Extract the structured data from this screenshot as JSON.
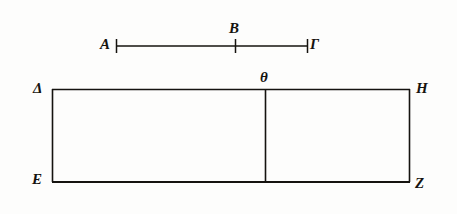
{
  "figure": {
    "background_color": "#fdfdfc",
    "ink_color": "#15130f"
  },
  "segment": {
    "labels": {
      "left": "A",
      "middle": "B",
      "right": "Γ"
    },
    "geometry": {
      "x_start": 116,
      "x_end": 308,
      "y": 46,
      "tick_middle_x": 235,
      "tick_half_height": 6
    }
  },
  "rectangle": {
    "labels": {
      "top_left": "Δ",
      "top_right": "H",
      "bottom_left": "E",
      "bottom_right": "Z",
      "divider_top": "θ"
    },
    "geometry": {
      "left": 52,
      "right": 410,
      "top": 89,
      "bottom": 182,
      "divider_x": 265
    }
  }
}
